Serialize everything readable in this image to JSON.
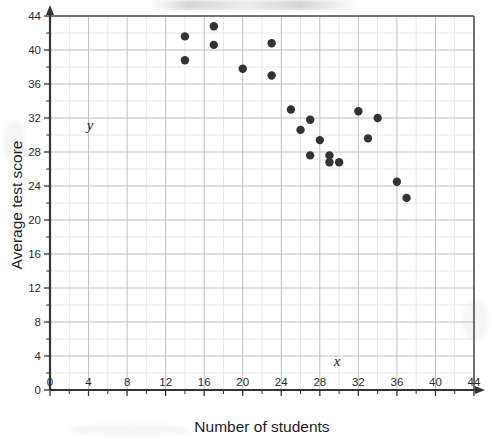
{
  "chart_data": {
    "type": "scatter",
    "title": "",
    "xlabel": "Number of students",
    "ylabel": "Average test score",
    "x_var_label": "x",
    "y_var_label": "y",
    "xlim": [
      0,
      44
    ],
    "ylim": [
      0,
      44
    ],
    "x_ticks": [
      0,
      4,
      8,
      12,
      16,
      20,
      24,
      28,
      32,
      36,
      40,
      44
    ],
    "y_ticks": [
      0,
      4,
      8,
      12,
      16,
      20,
      24,
      28,
      32,
      36,
      40,
      44
    ],
    "x_tick_labels": [
      "0",
      "4",
      "8",
      "12",
      "16",
      "20",
      "24",
      "28",
      "32",
      "36",
      "40",
      "44"
    ],
    "y_tick_labels": [
      "0",
      "4",
      "8",
      "12",
      "16",
      "20",
      "24",
      "28",
      "32",
      "36",
      "40",
      "44"
    ],
    "minor_grid_step": 2,
    "major_grid_step": 4,
    "grid": true,
    "legend": null,
    "marker_color": "#333333",
    "grid_color": "#b9b9b9",
    "minor_grid_color": "#dddddd",
    "axis_color": "#333333",
    "point_count": 20,
    "points": [
      {
        "x": 14,
        "y": 41.6
      },
      {
        "x": 14,
        "y": 38.8
      },
      {
        "x": 17,
        "y": 42.8
      },
      {
        "x": 17,
        "y": 40.6
      },
      {
        "x": 20,
        "y": 37.8
      },
      {
        "x": 23,
        "y": 40.8
      },
      {
        "x": 23,
        "y": 37.0
      },
      {
        "x": 25,
        "y": 33.0
      },
      {
        "x": 27,
        "y": 31.8
      },
      {
        "x": 26,
        "y": 30.6
      },
      {
        "x": 28,
        "y": 29.4
      },
      {
        "x": 27,
        "y": 27.6
      },
      {
        "x": 29,
        "y": 27.6
      },
      {
        "x": 29,
        "y": 26.8
      },
      {
        "x": 30,
        "y": 26.8
      },
      {
        "x": 32,
        "y": 32.8
      },
      {
        "x": 34,
        "y": 32.0
      },
      {
        "x": 33,
        "y": 29.6
      },
      {
        "x": 36,
        "y": 24.5
      },
      {
        "x": 37,
        "y": 22.6
      }
    ]
  },
  "axis_labels": {
    "x_title": "Number of students",
    "y_title": "Average test score"
  }
}
